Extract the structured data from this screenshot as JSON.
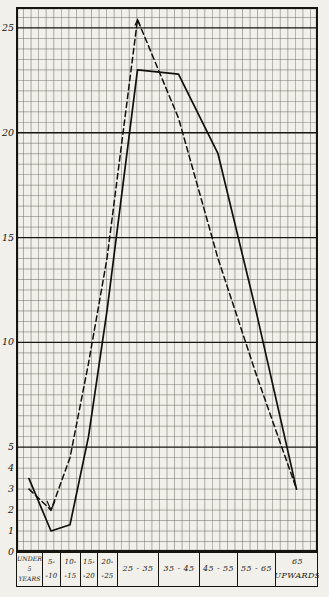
{
  "page": {
    "background_color": "#f2f0ea",
    "ink_color": "#17150f",
    "grid_minor_color": "#5d5952"
  },
  "chart_data": {
    "type": "line",
    "title": "",
    "legend": "none",
    "grid": "on",
    "categories": [
      "Under 5 years",
      "5-10",
      "10-15",
      "15-20",
      "20-25",
      "25-35",
      "35-45",
      "45-55",
      "55-65",
      "65 upwards"
    ],
    "x_tick_boxes": [
      {
        "lines": [
          "UNDER",
          "5",
          "YEARS"
        ]
      },
      {
        "lines": [
          "5-",
          "-10"
        ]
      },
      {
        "lines": [
          "10-",
          "-15"
        ]
      },
      {
        "lines": [
          "15-",
          "-20"
        ]
      },
      {
        "lines": [
          "20-",
          "-25"
        ]
      },
      {
        "lines": [
          "25 - 35"
        ]
      },
      {
        "lines": [
          "35 - 45"
        ]
      },
      {
        "lines": [
          "45 - 55"
        ]
      },
      {
        "lines": [
          "55 - 65"
        ]
      },
      {
        "lines": [
          "65",
          "UPWARDS"
        ]
      }
    ],
    "series": [
      {
        "name": "solid-line-series",
        "line_style": "solid",
        "values": [
          3.5,
          1,
          1.3,
          5.5,
          11.5,
          23,
          22.8,
          19,
          11.5,
          3
        ]
      },
      {
        "name": "dashed-line-series",
        "line_style": "dashed",
        "values": [
          3,
          2,
          4.5,
          9,
          14,
          25.4,
          20.7,
          14,
          8.5,
          3
        ]
      }
    ],
    "y_axis": {
      "tick_labels": [
        "25",
        "20",
        "15",
        "10",
        "5",
        "4",
        "3",
        "2",
        "1",
        "0"
      ],
      "tick_values": [
        25,
        20,
        15,
        10,
        5,
        4,
        3,
        2,
        1,
        0
      ],
      "range": [
        0,
        26
      ],
      "major_gridline_every": 5
    }
  }
}
